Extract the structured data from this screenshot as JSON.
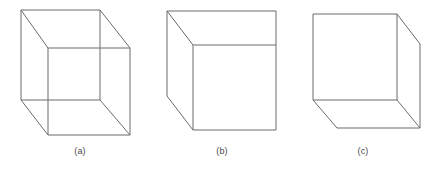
{
  "figure": {
    "width": 441,
    "height": 169,
    "background_color": "#ffffff",
    "stroke_color": "#6b6b6b",
    "face_color": "#ffffff",
    "caption_color": "#4a4a4a",
    "panels": [
      {
        "id": "panel-a",
        "caption": "(a)",
        "caption_x": 80,
        "caption_y": 146,
        "style": "wireframe",
        "description": "wireframe cube with all twelve edges drawn, hidden edges visible",
        "visible_edge_count": 12,
        "faces": [],
        "edges": [
          {
            "name": "back-top",
            "x1": 21,
            "y1": 10,
            "x2": 100,
            "y2": 10
          },
          {
            "name": "back-right",
            "x1": 100,
            "y1": 10,
            "x2": 100,
            "y2": 100
          },
          {
            "name": "back-bottom",
            "x1": 21,
            "y1": 100,
            "x2": 100,
            "y2": 100
          },
          {
            "name": "back-left",
            "x1": 21,
            "y1": 10,
            "x2": 21,
            "y2": 100
          },
          {
            "name": "front-top",
            "x1": 48,
            "y1": 48,
            "x2": 130,
            "y2": 48
          },
          {
            "name": "front-right",
            "x1": 130,
            "y1": 48,
            "x2": 130,
            "y2": 135
          },
          {
            "name": "front-bottom",
            "x1": 48,
            "y1": 135,
            "x2": 130,
            "y2": 135
          },
          {
            "name": "front-left",
            "x1": 48,
            "y1": 48,
            "x2": 48,
            "y2": 135
          },
          {
            "name": "connector-top-left",
            "x1": 21,
            "y1": 10,
            "x2": 48,
            "y2": 48
          },
          {
            "name": "connector-top-right",
            "x1": 100,
            "y1": 10,
            "x2": 130,
            "y2": 48
          },
          {
            "name": "connector-bottom-left",
            "x1": 21,
            "y1": 100,
            "x2": 48,
            "y2": 135
          },
          {
            "name": "connector-bottom-right",
            "x1": 100,
            "y1": 100,
            "x2": 130,
            "y2": 135
          }
        ]
      },
      {
        "id": "panel-b",
        "caption": "(b)",
        "caption_x": 222,
        "caption_y": 146,
        "style": "hidden-lines-removed",
        "description": "opaque cube seen from upper-left, showing front, left and top faces",
        "visible_edge_count": 9,
        "faces": [
          {
            "name": "top-face",
            "points": "167,11 276,11 276,45 193,45"
          },
          {
            "name": "left-face",
            "points": "167,11 193,45 193,130 167,96"
          },
          {
            "name": "front-face",
            "points": "193,45 276,45 276,130 193,130"
          }
        ],
        "edges": [
          {
            "name": "front-top",
            "x1": 193,
            "y1": 45,
            "x2": 276,
            "y2": 45
          },
          {
            "name": "front-right",
            "x1": 276,
            "y1": 45,
            "x2": 276,
            "y2": 130
          },
          {
            "name": "front-bottom",
            "x1": 193,
            "y1": 130,
            "x2": 276,
            "y2": 130
          },
          {
            "name": "front-left",
            "x1": 193,
            "y1": 45,
            "x2": 193,
            "y2": 130
          },
          {
            "name": "silhouette-left",
            "x1": 167,
            "y1": 11,
            "x2": 167,
            "y2": 96
          },
          {
            "name": "top-back-edge",
            "x1": 167,
            "y1": 11,
            "x2": 276,
            "y2": 11
          },
          {
            "name": "connector-top-left",
            "x1": 167,
            "y1": 11,
            "x2": 193,
            "y2": 45
          },
          {
            "name": "connector-top-right",
            "x1": 276,
            "y1": 11,
            "x2": 276,
            "y2": 45
          },
          {
            "name": "connector-bottom-left",
            "x1": 167,
            "y1": 96,
            "x2": 193,
            "y2": 130
          }
        ]
      },
      {
        "id": "panel-c",
        "caption": "(c)",
        "caption_x": 363,
        "caption_y": 146,
        "style": "hidden-lines-removed",
        "description": "opaque cube seen from lower-right, showing front, right and bottom faces",
        "visible_edge_count": 9,
        "faces": [
          {
            "name": "right-face",
            "points": "397,14 420,44 420,128 397,100"
          },
          {
            "name": "bottom-face",
            "points": "313,100 397,100 420,128 337,128"
          },
          {
            "name": "front-face",
            "points": "313,14 397,14 397,100 313,100"
          }
        ],
        "edges": [
          {
            "name": "front-top",
            "x1": 313,
            "y1": 14,
            "x2": 397,
            "y2": 14
          },
          {
            "name": "front-right",
            "x1": 397,
            "y1": 14,
            "x2": 397,
            "y2": 100
          },
          {
            "name": "front-bottom",
            "x1": 313,
            "y1": 100,
            "x2": 397,
            "y2": 100
          },
          {
            "name": "front-left",
            "x1": 313,
            "y1": 14,
            "x2": 313,
            "y2": 100
          },
          {
            "name": "connector-top-right",
            "x1": 397,
            "y1": 14,
            "x2": 420,
            "y2": 44
          },
          {
            "name": "silhouette-right",
            "x1": 420,
            "y1": 44,
            "x2": 420,
            "y2": 128
          },
          {
            "name": "connector-bottom-right",
            "x1": 397,
            "y1": 100,
            "x2": 420,
            "y2": 128
          },
          {
            "name": "connector-bottom-left",
            "x1": 313,
            "y1": 100,
            "x2": 337,
            "y2": 128
          },
          {
            "name": "bottom-back-edge",
            "x1": 337,
            "y1": 128,
            "x2": 420,
            "y2": 128
          }
        ]
      }
    ]
  }
}
